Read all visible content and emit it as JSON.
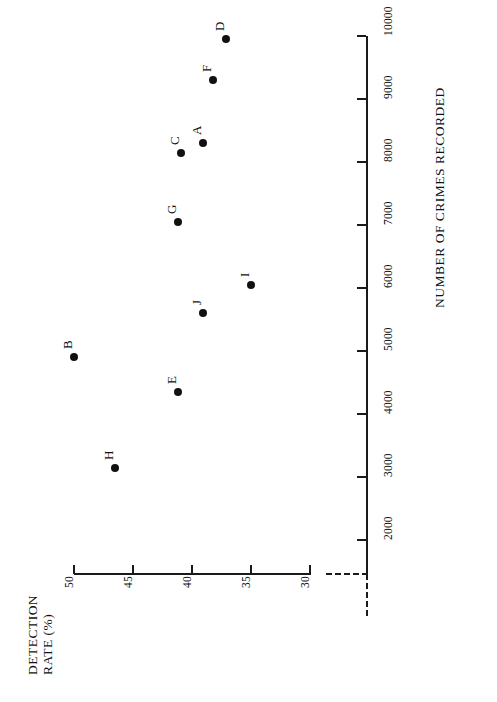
{
  "chart_data": {
    "type": "scatter",
    "title": "",
    "orientation": "rotated-90",
    "xlabel": "NUMBER OF CRIMES RECORDED",
    "ylabel": "DETECTION RATE (%)",
    "xlim": [
      2000,
      10300
    ],
    "ylim": [
      30,
      50
    ],
    "x_ticks": [
      2000,
      3000,
      4000,
      5000,
      6000,
      7000,
      8000,
      9000,
      10000
    ],
    "x_tick_labels": [
      "2000",
      "3000",
      "4000",
      "5000",
      "6000",
      "7000",
      "8000",
      "9000",
      "10000"
    ],
    "y_ticks": [
      50,
      45,
      40,
      35,
      30
    ],
    "y_tick_labels": [
      "50",
      "45",
      "40",
      "35",
      "30"
    ],
    "grid": false,
    "legend": "none",
    "axis_break": true,
    "marker_color": "#111111",
    "axis_color": "#1a1a1a",
    "points": [
      {
        "label": "A",
        "x": 8300,
        "y": 39.1
      },
      {
        "label": "B",
        "x": 4900,
        "y": 50.0
      },
      {
        "label": "C",
        "x": 8150,
        "y": 40.9
      },
      {
        "label": "D",
        "x": 9950,
        "y": 37.1
      },
      {
        "label": "E",
        "x": 4350,
        "y": 41.2
      },
      {
        "label": "F",
        "x": 9300,
        "y": 38.2
      },
      {
        "label": "G",
        "x": 7050,
        "y": 41.2
      },
      {
        "label": "H",
        "x": 3150,
        "y": 46.5
      },
      {
        "label": "I",
        "x": 6050,
        "y": 35.0
      },
      {
        "label": "J",
        "x": 5600,
        "y": 39.1
      }
    ]
  },
  "axes": {
    "x_title": "NUMBER OF CRIMES RECORDED",
    "y_title_line1": "DETECTION",
    "y_title_line2": "RATE (%)"
  }
}
